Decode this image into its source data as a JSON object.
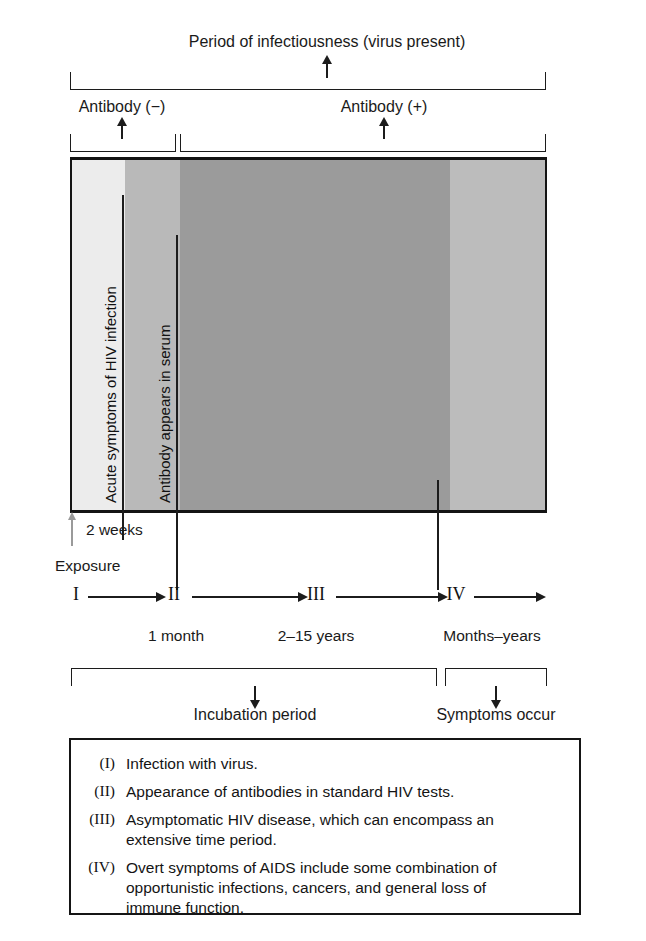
{
  "figure": {
    "title_top": "Period of infectiousness (virus present)",
    "antibody_negative": "Antibody (−)",
    "antibody_positive": "Antibody (+)"
  },
  "chart": {
    "bands": [
      {
        "name": "acute-light-band",
        "color": "#ececec",
        "x": 70,
        "width": 55
      },
      {
        "name": "early-gray-band",
        "color": "#b9b9b9",
        "x": 125,
        "width": 55
      },
      {
        "name": "asymptomatic-dark-band",
        "color": "#9b9b9b",
        "x": 180,
        "width": 270
      },
      {
        "name": "symptomatic-gray-band",
        "color": "#bcbcbc",
        "x": 450,
        "width": 96
      }
    ],
    "inner_labels": [
      {
        "name": "acute-symptoms-label",
        "text": "Acute symptoms of HIV infection",
        "x": 123
      },
      {
        "name": "antibody-serum-label",
        "text": "Antibody appears in serum",
        "x": 177
      }
    ]
  },
  "axis": {
    "exposure_label": "Exposure",
    "two_weeks_label": "2 weeks",
    "stages": [
      {
        "numeral": "I",
        "x": 76,
        "duration": "",
        "duration_x": 0
      },
      {
        "numeral": "II",
        "x": 174,
        "duration": "1 month",
        "duration_x": 176
      },
      {
        "numeral": "III",
        "x": 316,
        "duration": "2–15 years",
        "duration_x": 316
      },
      {
        "numeral": "IV",
        "x": 456,
        "duration": "Months–years",
        "duration_x": 492
      }
    ]
  },
  "periods": {
    "incubation": "Incubation period",
    "symptoms": "Symptoms occur"
  },
  "legend": {
    "items": [
      {
        "numeral": "(I)",
        "text": "Infection with virus."
      },
      {
        "numeral": "(II)",
        "text": "Appearance of antibodies in standard HIV tests."
      },
      {
        "numeral": "(III)",
        "text": "Asymptomatic HIV disease, which can encompass an extensive time period."
      },
      {
        "numeral": "(IV)",
        "text": "Overt symptoms of AIDS include some combination of opportunistic infections, cancers, and general loss of immune function."
      }
    ]
  },
  "colors": {
    "ink": "#141414",
    "exposure_arrow": "#9a9a9a"
  }
}
